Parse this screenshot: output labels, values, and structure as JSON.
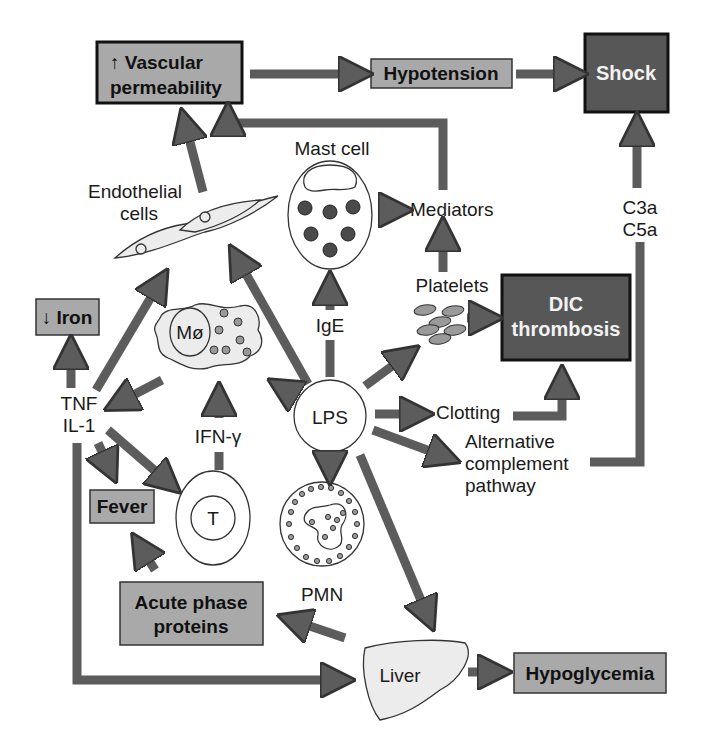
{
  "diagram": {
    "nodes": {
      "vascular_permeability": {
        "line1": "↑ Vascular",
        "line2": "permeability"
      },
      "hypotension": {
        "label": "Hypotension"
      },
      "shock": {
        "label": "Shock"
      },
      "mast_cell": {
        "label": "Mast cell"
      },
      "mediators": {
        "label": "Mediators"
      },
      "endothelial_cells": {
        "line1": "Endothelial",
        "line2": "cells"
      },
      "c3a_c5a": {
        "line1": "C3a",
        "line2": "C5a"
      },
      "platelets": {
        "label": "Platelets"
      },
      "dic_thrombosis": {
        "line1": "DIC",
        "line2": "thrombosis"
      },
      "iron": {
        "label": "↓ Iron"
      },
      "macrophage": {
        "label": "Mø"
      },
      "ige": {
        "label": "IgE"
      },
      "tnf_il1": {
        "line1": "TNF",
        "line2": "IL-1"
      },
      "ifn_gamma": {
        "label": "IFN-γ"
      },
      "lps": {
        "label": "LPS"
      },
      "clotting": {
        "label": "Clotting"
      },
      "alt_complement": {
        "line1": "Alternative",
        "line2": "complement",
        "line3": "pathway"
      },
      "fever": {
        "label": "Fever"
      },
      "t_cell": {
        "label": "T"
      },
      "pmn": {
        "label": "PMN"
      },
      "acute_phase": {
        "line1": "Acute phase",
        "line2": "proteins"
      },
      "liver": {
        "label": "Liver"
      },
      "hypoglycemia": {
        "label": "Hypoglycemia"
      }
    },
    "edges": [
      {
        "from": "vascular_permeability",
        "to": "hypotension"
      },
      {
        "from": "hypotension",
        "to": "shock"
      },
      {
        "from": "endothelial_cells",
        "to": "vascular_permeability"
      },
      {
        "from": "mediators",
        "to": "vascular_permeability"
      },
      {
        "from": "mast_cell",
        "to": "mediators"
      },
      {
        "from": "platelets",
        "to": "mediators"
      },
      {
        "from": "platelets",
        "to": "dic_thrombosis"
      },
      {
        "from": "c3a_c5a",
        "to": "shock"
      },
      {
        "from": "alt_complement",
        "to": "c3a_c5a"
      },
      {
        "from": "ige",
        "to": "mast_cell"
      },
      {
        "from": "lps",
        "to": "ige"
      },
      {
        "from": "lps",
        "to": "endothelial_cells"
      },
      {
        "from": "lps",
        "to": "macrophage"
      },
      {
        "from": "lps",
        "to": "platelets"
      },
      {
        "from": "lps",
        "to": "clotting"
      },
      {
        "from": "lps",
        "to": "alt_complement"
      },
      {
        "from": "lps",
        "to": "pmn"
      },
      {
        "from": "lps",
        "to": "liver"
      },
      {
        "from": "clotting",
        "to": "dic_thrombosis"
      },
      {
        "from": "macrophage",
        "to": "tnf_il1"
      },
      {
        "from": "tnf_il1",
        "to": "iron"
      },
      {
        "from": "tnf_il1",
        "to": "endothelial_cells"
      },
      {
        "from": "tnf_il1",
        "to": "fever"
      },
      {
        "from": "tnf_il1",
        "to": "t_cell"
      },
      {
        "from": "tnf_il1",
        "to": "liver"
      },
      {
        "from": "t_cell",
        "to": "ifn_gamma"
      },
      {
        "from": "ifn_gamma",
        "to": "macrophage"
      },
      {
        "from": "acute_phase",
        "to": "fever"
      },
      {
        "from": "liver",
        "to": "acute_phase"
      },
      {
        "from": "liver",
        "to": "hypoglycemia"
      }
    ]
  }
}
